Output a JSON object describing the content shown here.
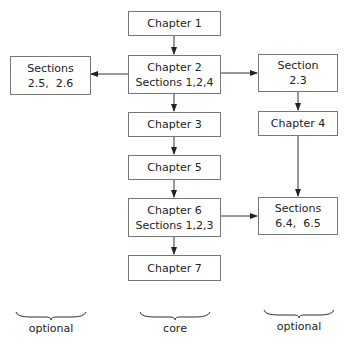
{
  "diagram": {
    "type": "flowchart",
    "nodes": [
      {
        "id": "ch1",
        "lines": [
          "Chapter 1"
        ]
      },
      {
        "id": "ch2",
        "lines": [
          "Chapter 2",
          "Sections 1,2,4"
        ]
      },
      {
        "id": "sec25_26",
        "lines": [
          "Sections",
          "2.5,  2.6"
        ]
      },
      {
        "id": "sec23",
        "lines": [
          "Section",
          "2.3"
        ]
      },
      {
        "id": "ch3",
        "lines": [
          "Chapter 3"
        ]
      },
      {
        "id": "ch4",
        "lines": [
          "Chapter 4"
        ]
      },
      {
        "id": "ch5",
        "lines": [
          "Chapter 5"
        ]
      },
      {
        "id": "ch6",
        "lines": [
          "Chapter 6",
          "Sections 1,2,3"
        ]
      },
      {
        "id": "sec64_65",
        "lines": [
          "Sections",
          "6.4,  6.5"
        ]
      },
      {
        "id": "ch7",
        "lines": [
          "Chapter 7"
        ]
      }
    ],
    "edges": [
      {
        "from": "ch1",
        "to": "ch2"
      },
      {
        "from": "ch2",
        "to": "sec25_26"
      },
      {
        "from": "ch2",
        "to": "sec23"
      },
      {
        "from": "ch2",
        "to": "ch3"
      },
      {
        "from": "sec23",
        "to": "ch4"
      },
      {
        "from": "ch3",
        "to": "ch5"
      },
      {
        "from": "ch5",
        "to": "ch6"
      },
      {
        "from": "ch4",
        "to": "sec64_65"
      },
      {
        "from": "ch6",
        "to": "sec64_65"
      },
      {
        "from": "ch6",
        "to": "ch7"
      }
    ],
    "column_labels": [
      "optional",
      "core",
      "optional"
    ]
  }
}
